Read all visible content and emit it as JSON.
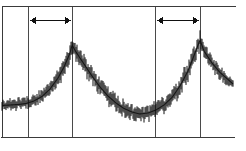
{
  "figure": {
    "name": "noisy-periodic-trace",
    "width": 246,
    "height": 151,
    "background_color": "#ffffff",
    "ink_color": "#111111",
    "grid_color": "#4a4a4a",
    "axis_color": "#3a3a3a"
  },
  "axes": {
    "top_rule": {
      "x1": 2,
      "x2": 236,
      "y": 6,
      "visible": true
    },
    "bottom_rule": {
      "x1": 1,
      "x2": 235,
      "y": 137,
      "visible": true
    },
    "left_rule": {
      "x": 2,
      "y1": 6,
      "y2": 137,
      "visible": true
    },
    "right_rule_visible": false,
    "gridlines_x": [
      28,
      72,
      155,
      200
    ],
    "gridline_top": 6,
    "gridline_bottom": 137,
    "tick_labels_visible": false,
    "axis_title_x": "",
    "axis_title_y": ""
  },
  "annotations": {
    "arrows": [
      {
        "label": "period-marker-left",
        "x_start": 30,
        "x_end": 71,
        "y": 20,
        "double_headed": true,
        "text": ""
      },
      {
        "label": "period-marker-right",
        "x_start": 157,
        "x_end": 199,
        "y": 20,
        "double_headed": true,
        "text": ""
      }
    ]
  },
  "chart_data": {
    "type": "line",
    "title": "",
    "subtitle": "",
    "xlabel": "",
    "ylabel": "",
    "grid": true,
    "legend_position": "none",
    "xlim": [
      0,
      246
    ],
    "ylim": [
      137,
      30
    ],
    "series": [
      {
        "name": "signal-envelope-upper",
        "x": [
          2,
          10,
          18,
          26,
          34,
          42,
          50,
          58,
          64,
          70,
          72,
          76,
          84,
          92,
          100,
          108,
          116,
          124,
          132,
          140,
          148,
          156,
          164,
          172,
          180,
          188,
          195,
          200,
          204,
          212,
          220,
          228,
          233
        ],
        "values": [
          101,
          100,
          99,
          98,
          95,
          90,
          82,
          70,
          58,
          44,
          38,
          44,
          56,
          68,
          79,
          88,
          95,
          101,
          105,
          107,
          106,
          103,
          98,
          90,
          78,
          62,
          44,
          32,
          44,
          56,
          66,
          74,
          80
        ]
      },
      {
        "name": "signal-envelope-lower",
        "x": [
          2,
          10,
          18,
          26,
          34,
          42,
          50,
          58,
          64,
          70,
          72,
          76,
          84,
          92,
          100,
          108,
          116,
          124,
          132,
          140,
          148,
          156,
          164,
          172,
          180,
          188,
          195,
          200,
          204,
          212,
          220,
          228,
          233
        ],
        "values": [
          110,
          110,
          110,
          109,
          107,
          103,
          96,
          86,
          76,
          62,
          52,
          60,
          72,
          84,
          95,
          104,
          111,
          116,
          119,
          121,
          120,
          117,
          112,
          105,
          94,
          80,
          62,
          48,
          58,
          70,
          79,
          85,
          88
        ]
      }
    ],
    "peaks": [
      {
        "name": "peak-1",
        "x": 72,
        "y": 38,
        "relative_height": 0.78
      },
      {
        "name": "peak-2",
        "x": 200,
        "y": 32,
        "relative_height": 0.85
      }
    ],
    "troughs": [
      {
        "name": "trough-left",
        "x": 14,
        "y": 105
      },
      {
        "name": "trough-center",
        "x": 138,
        "y": 120
      }
    ],
    "noise": {
      "style": "dense-vertical-strokes",
      "stroke_count": 232,
      "stroke_width": 1,
      "amplitude_peak": 13,
      "amplitude_trough": 7
    }
  }
}
